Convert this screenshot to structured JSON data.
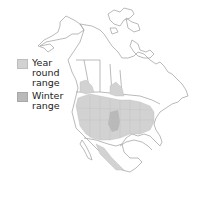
{
  "map": {
    "region": "North America",
    "colors": {
      "year_round": "#d2d2d2",
      "winter": "#b9b9b9",
      "border": "#a5a5a5",
      "background": "#ffffff"
    }
  },
  "legend": {
    "items": [
      {
        "label": "Year round range",
        "color": "#d2d2d2"
      },
      {
        "label": "Winter range",
        "color": "#b9b9b9"
      }
    ]
  }
}
